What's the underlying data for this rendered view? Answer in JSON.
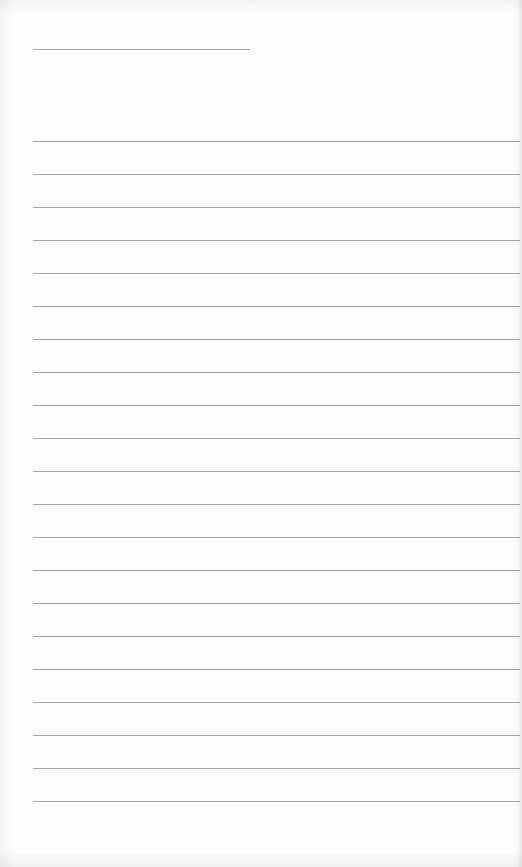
{
  "page": {
    "type": "lined-paper",
    "background_color": "#fdfdfd",
    "line_color": "#a6a6a6",
    "header_line": {
      "x": 33,
      "y": 49,
      "width": 217
    },
    "rule_lines": {
      "count": 21,
      "start_y": 141,
      "spacing": 33,
      "x": 33,
      "right": 520
    }
  }
}
